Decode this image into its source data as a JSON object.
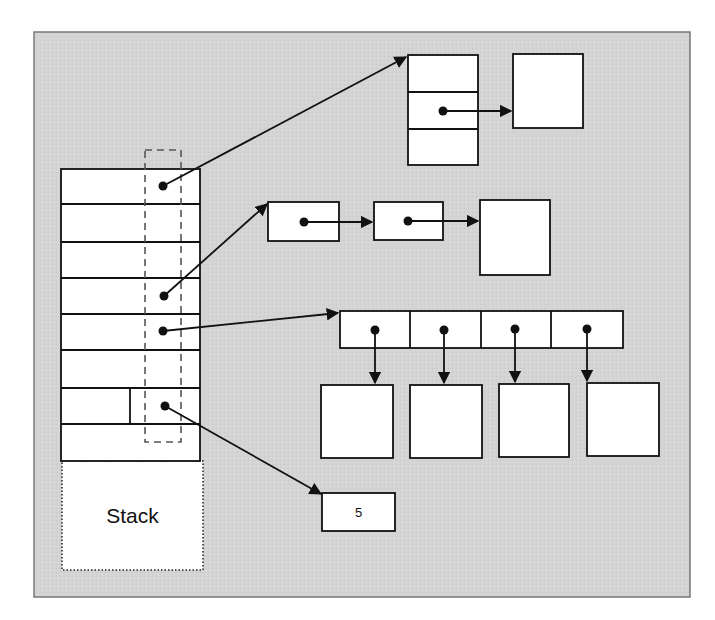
{
  "figure": {
    "type": "memory-layout-diagram",
    "background_color": "#d4d4d4",
    "box_fill": "#ffffff",
    "stroke_color": "#111111",
    "dashed_color": "#555555"
  },
  "stack": {
    "label": "Stack",
    "rows": 8,
    "pointer_slots": 4
  },
  "heap": {
    "record": {
      "fields": 3,
      "pointer_field_index": 1
    },
    "linked_list": {
      "nodes": 2,
      "terminal": "object"
    },
    "array": {
      "cells": 4,
      "each_points_to": "object"
    },
    "boxed_value": {
      "value": "5"
    }
  }
}
